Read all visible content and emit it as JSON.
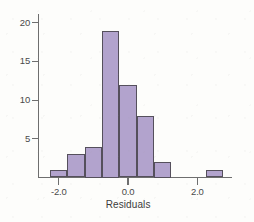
{
  "chart_data": {
    "type": "bar",
    "title": "",
    "subtitle": "",
    "xlabel": "Residuals",
    "ylabel": "",
    "grid": false,
    "legend": false,
    "legend_position": "none",
    "bin_width": 0.5,
    "xlim": [
      -2.6,
      3.0
    ],
    "ylim": [
      0,
      21
    ],
    "xticks": [
      -2.0,
      0.0,
      2.0
    ],
    "xtick_labels": [
      "-2.0",
      "0.0",
      "2.0"
    ],
    "yticks": [
      5,
      10,
      15,
      20
    ],
    "ytick_labels": [
      "5",
      "10",
      "15",
      "20"
    ],
    "bin_edges": [
      -2.25,
      -1.75,
      -1.25,
      -0.75,
      -0.25,
      0.25,
      0.75,
      1.25,
      2.25,
      2.75
    ],
    "bin_centers": [
      -2.0,
      -1.5,
      -1.0,
      -0.5,
      0.0,
      0.5,
      1.0,
      2.5
    ],
    "values": [
      1,
      3,
      4,
      19,
      12,
      8,
      2,
      1
    ],
    "bars": [
      {
        "center": -2.0,
        "left": -2.25,
        "right": -1.75,
        "count": 1
      },
      {
        "center": -1.5,
        "left": -1.75,
        "right": -1.25,
        "count": 3
      },
      {
        "center": -1.0,
        "left": -1.25,
        "right": -0.75,
        "count": 4
      },
      {
        "center": -0.5,
        "left": -0.75,
        "right": -0.25,
        "count": 19
      },
      {
        "center": 0.0,
        "left": -0.25,
        "right": 0.25,
        "count": 12
      },
      {
        "center": 0.5,
        "left": 0.25,
        "right": 0.75,
        "count": 8
      },
      {
        "center": 1.0,
        "left": 0.75,
        "right": 1.25,
        "count": 2
      },
      {
        "center": 2.5,
        "left": 2.25,
        "right": 2.75,
        "count": 1
      }
    ],
    "total_count": 50,
    "colors": {
      "bar_fill": "#b2a3cd",
      "bar_stroke": "#55505c",
      "axis": "#6e6e6e",
      "text": "#4a4a4a",
      "background": "#fdfdfb"
    }
  },
  "axes": {
    "x_title": "Residuals",
    "y_title": ""
  }
}
